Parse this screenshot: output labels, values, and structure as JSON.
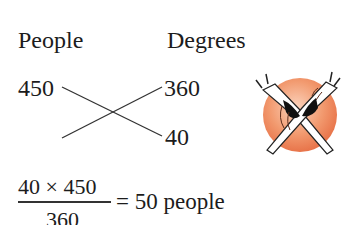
{
  "headers": {
    "left": "People",
    "right": "Degrees"
  },
  "values": {
    "people_top": "450",
    "degrees_top": "360",
    "degrees_bottom": "40"
  },
  "formula": {
    "numerator": "40 × 450",
    "denominator": "360",
    "result": "= 50 people"
  },
  "illustration": {
    "name": "crossed-dancers-icon",
    "circle_color": "#ef8a62"
  }
}
